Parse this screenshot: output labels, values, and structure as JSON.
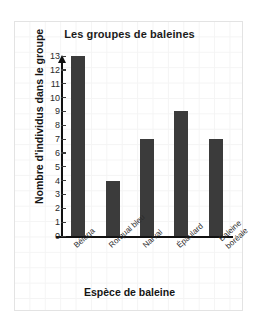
{
  "chart_data": {
    "type": "bar",
    "title": "Les groupes de baleines",
    "xlabel": "Espèce de baleine",
    "ylabel": "Nombre d'individus dans le groupe",
    "categories": [
      "Béluga",
      "Rorqual bleu",
      "Narval",
      "Épaulard",
      "Baleine boréale"
    ],
    "values": [
      13,
      4,
      7,
      9,
      7
    ],
    "ylim": [
      0,
      13
    ],
    "yticks": [
      0,
      1,
      2,
      3,
      4,
      5,
      6,
      7,
      8,
      9,
      10,
      11,
      12,
      13
    ],
    "ytick_labels": [
      "0",
      "1",
      "2",
      "3",
      "4",
      "5",
      "6",
      "7",
      "8",
      "9",
      "10",
      "11",
      "12",
      "13"
    ],
    "grid": true,
    "legend": null,
    "bar_color": "#3b3b3b",
    "axis_color": "#111111",
    "grid_color": "#f4f4f4",
    "background_color": "#ffffff"
  }
}
